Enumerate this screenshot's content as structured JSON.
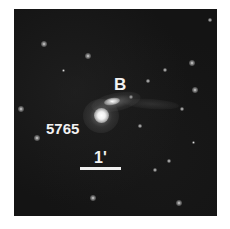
{
  "image": {
    "description": "Grayscale sky image of interacting galaxy pair",
    "background_color": "#141414",
    "frame_border_color": "#ffffff"
  },
  "labels": {
    "galaxy_main": "5765",
    "galaxy_companion": "B",
    "scale_bar": "1'"
  },
  "objects": {
    "galaxy_main": {
      "x": 101,
      "y": 115,
      "shape": "round",
      "brightness": "bright"
    },
    "galaxy_companion": {
      "x": 111,
      "y": 102,
      "shape": "elongated",
      "brightness": "bright"
    }
  },
  "stars": [
    {
      "x": 44,
      "y": 44,
      "r": 2
    },
    {
      "x": 88,
      "y": 56,
      "r": 2
    },
    {
      "x": 192,
      "y": 63,
      "r": 2
    },
    {
      "x": 195,
      "y": 90,
      "r": 2
    },
    {
      "x": 21,
      "y": 109,
      "r": 2
    },
    {
      "x": 182,
      "y": 109,
      "r": 1.5
    },
    {
      "x": 37,
      "y": 138,
      "r": 2
    },
    {
      "x": 169,
      "y": 161,
      "r": 1.5
    },
    {
      "x": 155,
      "y": 170,
      "r": 1.5
    },
    {
      "x": 93,
      "y": 198,
      "r": 2
    },
    {
      "x": 179,
      "y": 203,
      "r": 2
    },
    {
      "x": 165,
      "y": 70,
      "r": 1.5
    },
    {
      "x": 148,
      "y": 81,
      "r": 1.2
    },
    {
      "x": 131,
      "y": 97,
      "r": 1.5
    },
    {
      "x": 140,
      "y": 126,
      "r": 1.2
    },
    {
      "x": 210,
      "y": 20,
      "r": 1.2
    },
    {
      "x": 63,
      "y": 70,
      "r": 1
    },
    {
      "x": 193,
      "y": 142,
      "r": 1
    }
  ],
  "scale_bar": {
    "x1": 80,
    "x2": 121,
    "y": 168
  }
}
